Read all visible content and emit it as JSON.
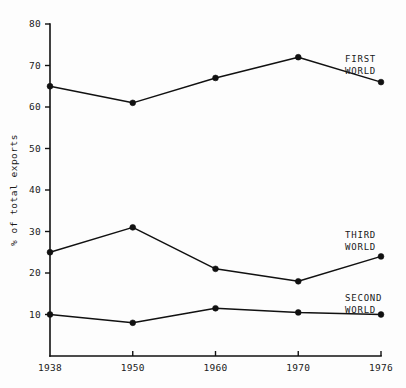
{
  "chart_data": {
    "type": "line",
    "title": "",
    "xlabel": "",
    "ylabel": "% of total exports",
    "categories": [
      "1938",
      "1950",
      "1960",
      "1970",
      "1976"
    ],
    "ylim": [
      0,
      80
    ],
    "yticks": [
      10,
      20,
      30,
      40,
      50,
      60,
      70,
      80
    ],
    "grid": false,
    "legend_position": "inline-right-of-series",
    "series": [
      {
        "name": "FIRST WORLD",
        "label_line1": "FIRST",
        "label_line2": "WORLD",
        "values": [
          65,
          61,
          67,
          72,
          66
        ]
      },
      {
        "name": "THIRD WORLD",
        "label_line1": "THIRD",
        "label_line2": "WORLD",
        "values": [
          25,
          31,
          21,
          18,
          24
        ]
      },
      {
        "name": "SECOND WORLD",
        "label_line1": "SECOND",
        "label_line2": "WORLD",
        "values": [
          10,
          8,
          11.5,
          10.5,
          10
        ]
      }
    ]
  },
  "style": {
    "line_color": "#111111",
    "marker_color": "#111111",
    "axis_color": "#111111",
    "background": "#fdfdfd",
    "text_color": "#1a1a1a"
  }
}
